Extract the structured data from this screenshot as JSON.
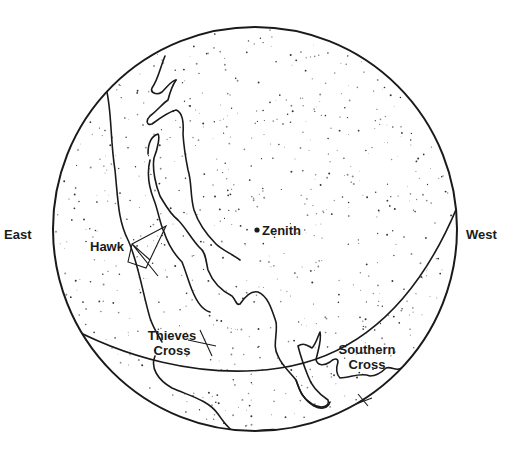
{
  "diagram": {
    "type": "sky-map",
    "colors": {
      "ink": "#1a1a1a",
      "background": "#ffffff"
    },
    "directions": {
      "east": "East",
      "west": "West"
    },
    "labels": {
      "zenith": "Zenith",
      "hawk": "Hawk",
      "thieves_cross_line1": "Thieves",
      "thieves_cross_line2": "Cross",
      "southern_cross_line1": "Southern",
      "southern_cross_line2": "Cross"
    }
  }
}
